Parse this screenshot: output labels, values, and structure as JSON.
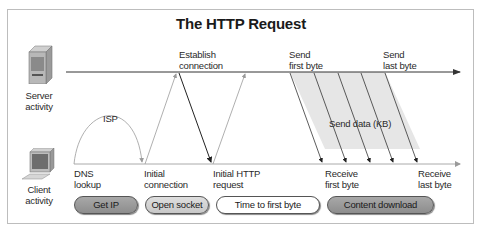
{
  "title": "The HTTP Request",
  "actors": {
    "server": {
      "label": "Server\nactivity",
      "icon": "server-icon"
    },
    "client": {
      "label": "Client\nactivity",
      "icon": "computer-icon"
    }
  },
  "server_events": [
    {
      "id": "establish",
      "label": "Establish\nconnection"
    },
    {
      "id": "send_first",
      "label": "Send\nfirst byte"
    },
    {
      "id": "send_last",
      "label": "Send\nlast byte"
    }
  ],
  "client_events": [
    {
      "id": "dns",
      "label": "DNS\nlookup"
    },
    {
      "id": "initial_conn",
      "label": "Initial\nconnection"
    },
    {
      "id": "initial_http",
      "label": "Initial HTTP\nrequest"
    },
    {
      "id": "recv_first",
      "label": "Receive\nfirst byte"
    },
    {
      "id": "recv_last",
      "label": "Receive\nlast byte"
    }
  ],
  "annotations": {
    "isp": "ISP",
    "send_data": "Send data (KB)"
  },
  "phases": [
    {
      "label": "Get IP",
      "style": "dark"
    },
    {
      "label": "Open socket",
      "style": "mid"
    },
    {
      "label": "Time to first byte",
      "style": "light"
    },
    {
      "label": "Content download",
      "style": "dark"
    }
  ],
  "colors": {
    "timeline": "#444444",
    "thin_arrow": "#9a9a9a",
    "dark_arrow": "#222222",
    "data_fill": "#e6e6e6",
    "frame": "#bdbdbd"
  }
}
